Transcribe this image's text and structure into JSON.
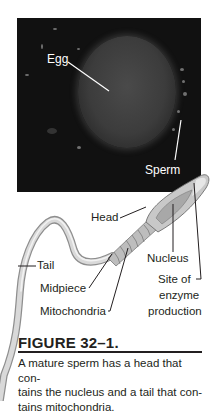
{
  "photo": {
    "labels": {
      "egg": "Egg",
      "sperm": "Sperm"
    }
  },
  "diagram": {
    "labels": {
      "head": "Head",
      "tail": "Tail",
      "nucleus": "Nucleus",
      "midpiece": "Midpiece",
      "mitochondria": "Mitochondria",
      "site_of_enzyme_line1": "Site of",
      "site_of_enzyme_line2": "enzyme",
      "site_of_enzyme_line3": "production"
    }
  },
  "figure": {
    "title": "FIGURE 32–1.",
    "caption_line1": "A mature sperm has a head that con-",
    "caption_line2": "tains the nucleus and a tail that con-",
    "caption_line3": "tains mitochondria."
  }
}
